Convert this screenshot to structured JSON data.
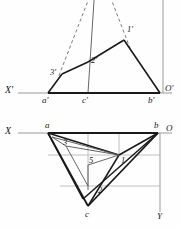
{
  "figure": {
    "colors": {
      "ink": "#1a1a1a",
      "thin": "#555555",
      "axis": "#8a8a8a",
      "dashed": "#6e6e6e",
      "background": "#fefefe"
    },
    "views": [
      {
        "name": "frontal-projection",
        "id": "upper-view",
        "axis_label": "X'",
        "origin_label": "O'"
      },
      {
        "name": "horizontal-projection",
        "id": "lower-view",
        "axis_label": "X",
        "origin_label": "O",
        "vertical_axis_label": "Y"
      }
    ],
    "labels": {
      "x_prime": "X'",
      "o_prime": "O'",
      "a_prime": "a'",
      "b_prime": "b'",
      "c_prime": "c'",
      "one_prime": "1'",
      "two_prime": "2'",
      "three_prime": "3'",
      "x": "X",
      "o": "O",
      "y": "Y",
      "a": "a",
      "b": "b",
      "c": "c",
      "one": "1",
      "two": "2",
      "three": "3",
      "five": "5"
    },
    "geometry": {
      "upper": {
        "ground_line_y": 93,
        "ground_line_x1": 18,
        "ground_line_x2": 172,
        "vertical_axis_x": 163,
        "vertical_axis_y1": 0,
        "vertical_axis_y2": 93,
        "a_prime": [
          48,
          93
        ],
        "b_prime": [
          160,
          93
        ],
        "c_prime": [
          88,
          93
        ],
        "one_prime": [
          124,
          40
        ],
        "two_prime": [
          88,
          62
        ],
        "three_prime": [
          62,
          74
        ],
        "apex_offscreen": [
          98,
          -26
        ]
      },
      "lower": {
        "ground_line_y": 133,
        "ground_line_x1": 18,
        "ground_line_x2": 172,
        "vertical_axis_x": 160,
        "vertical_axis_y1": 133,
        "vertical_axis_y2": 212,
        "a": [
          48,
          133
        ],
        "b": [
          158,
          133
        ],
        "c": [
          88,
          206
        ],
        "one": [
          119,
          155
        ],
        "two": [
          95,
          186
        ],
        "three": [
          62,
          140
        ],
        "five": [
          88,
          165
        ]
      }
    }
  }
}
